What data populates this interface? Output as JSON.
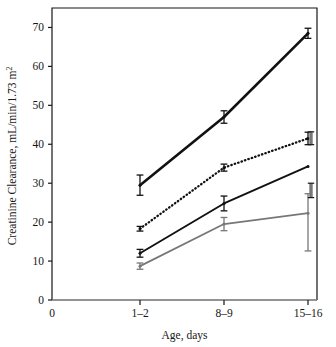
{
  "chart_data": {
    "type": "line",
    "title": "",
    "xlabel": "Age, days",
    "ylabel": "Creatinine Clearance, mL/min/1.73 m",
    "ylabel_superscript": "2",
    "categories": [
      "1–2",
      "8–9",
      "15–16"
    ],
    "x_tick_labels": [
      "0",
      "1–2",
      "8–9",
      "15–16"
    ],
    "y_tick_labels": [
      "0",
      "10",
      "20",
      "30",
      "40",
      "50",
      "60",
      "70"
    ],
    "y_ticks": [
      0,
      10,
      20,
      30,
      40,
      50,
      60,
      70
    ],
    "ylim": [
      0,
      75
    ],
    "xlim": [
      0,
      3.15
    ],
    "grid": false,
    "legend": "none",
    "error_bar_style": "symmetric-capped",
    "series": [
      {
        "name": "series-1-thick-black-solid",
        "style": "solid",
        "color": "#111111",
        "line_width": 2.6,
        "values": [
          29.5,
          47.0,
          68.5
        ],
        "err_low": [
          2.6,
          1.6,
          1.3
        ],
        "err_high": [
          2.6,
          1.6,
          1.3
        ]
      },
      {
        "name": "series-2-black-dotted",
        "style": "dotted",
        "color": "#111111",
        "line_width": 2.3,
        "values": [
          18.3,
          34.0,
          41.5
        ],
        "err_low": [
          0.6,
          0.9,
          1.6
        ],
        "err_high": [
          0.6,
          0.9,
          1.6
        ]
      },
      {
        "name": "series-3-black-solid",
        "style": "solid",
        "color": "#111111",
        "line_width": 1.9,
        "values": [
          12.0,
          24.8,
          34.3
        ],
        "err_low": [
          1.0,
          1.9,
          0.0
        ],
        "err_high": [
          1.0,
          1.9,
          0.0
        ]
      },
      {
        "name": "series-4-gray-solid",
        "style": "solid",
        "color": "#777777",
        "line_width": 1.7,
        "values": [
          8.7,
          19.5,
          22.3
        ],
        "err_low": [
          0.8,
          1.7,
          9.7
        ],
        "err_high": [
          0.8,
          1.7,
          5.0
        ]
      }
    ],
    "extra_error_bars": [
      {
        "name": "right-upper-marker",
        "x_category": "15–16",
        "value": 41.5,
        "low": 39.9,
        "high": 43.2,
        "color": "#777777"
      },
      {
        "name": "right-mid-marker",
        "x_category": "15–16",
        "value": 28.0,
        "low": 26.3,
        "high": 30.0,
        "color": "#777777"
      }
    ]
  }
}
